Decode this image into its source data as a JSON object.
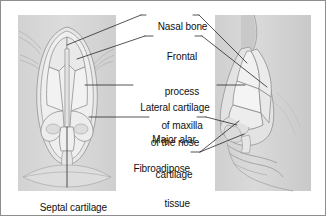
{
  "figure": {
    "border_color": "#8d8d8d",
    "background_color": "#ffffff",
    "text_color": "#111111",
    "leader_line_color": "#2a2a2a",
    "skin_tone_color": "#d9d9d9",
    "cartilage_fill_color": "#efefef",
    "outline_color": "#9a9a9a"
  },
  "views": {
    "anterior": {
      "name": "anterior-view-of-nose",
      "description": "Front view of the nose showing bilateral cartilages and septum"
    },
    "lateral": {
      "name": "lateral-view-of-nose",
      "description": "Side profile of the nose showing cartilage segments"
    }
  },
  "labels": [
    {
      "id": "nasal-bone",
      "text": "Nasal bone",
      "align": "left",
      "x": 146,
      "y": 9
    },
    {
      "id": "frontal-process-of-maxilla",
      "text": "Frontal\nprocess\nof maxilla",
      "align": "center",
      "x": 155,
      "y": 30
    },
    {
      "id": "lateral-cartilage-of-the-nose",
      "text": "Lateral cartilage\nof the nose",
      "align": "center",
      "x": 137,
      "y": 79
    },
    {
      "id": "major-alar-cartilage",
      "text": "Major alar\ncartilage",
      "align": "center",
      "x": 152,
      "y": 111
    },
    {
      "id": "fibroadipose-tissue",
      "text": "Fibroadipose\ntissue",
      "align": "center",
      "x": 140,
      "y": 140
    },
    {
      "id": "septal-cartilage",
      "text": "Septal cartilage",
      "align": "center",
      "x": 30,
      "y": 190
    }
  ],
  "label_text": {
    "nasal_bone": "Nasal bone",
    "frontal_process_line1": "Frontal",
    "frontal_process_line2": "process",
    "frontal_process_line3": "of maxilla",
    "lateral_cartilage_line1": "Lateral cartilage",
    "lateral_cartilage_line2": "of the nose",
    "major_alar_line1": "Major alar",
    "major_alar_line2": "cartilage",
    "fibroadipose_line1": "Fibroadipose",
    "fibroadipose_line2": "tissue",
    "septal_cartilage": "Septal cartilage"
  }
}
